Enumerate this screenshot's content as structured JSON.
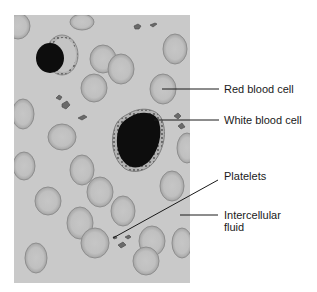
{
  "diagram": {
    "title": "",
    "colors": {
      "background": "#ffffff",
      "smear": "#c9c9c9",
      "rbc_fill": "#c2c2c2",
      "rbc_edge": "#8e8e8e",
      "wbc_nucleus": "#0d0d0d",
      "wbc_membrane": "#a8a8a8",
      "platelet": "#6a6a6a",
      "leader_line": "#1a1a1a",
      "label_text": "#1a1a1a"
    },
    "labels": [
      {
        "id": "red-blood-cell",
        "text": "Red blood cell"
      },
      {
        "id": "white-blood-cell",
        "text": "White blood cell"
      },
      {
        "id": "platelets",
        "text": "Platelets"
      },
      {
        "id": "intercellular-fluid",
        "text": "Intercellular\nfluid"
      }
    ]
  }
}
